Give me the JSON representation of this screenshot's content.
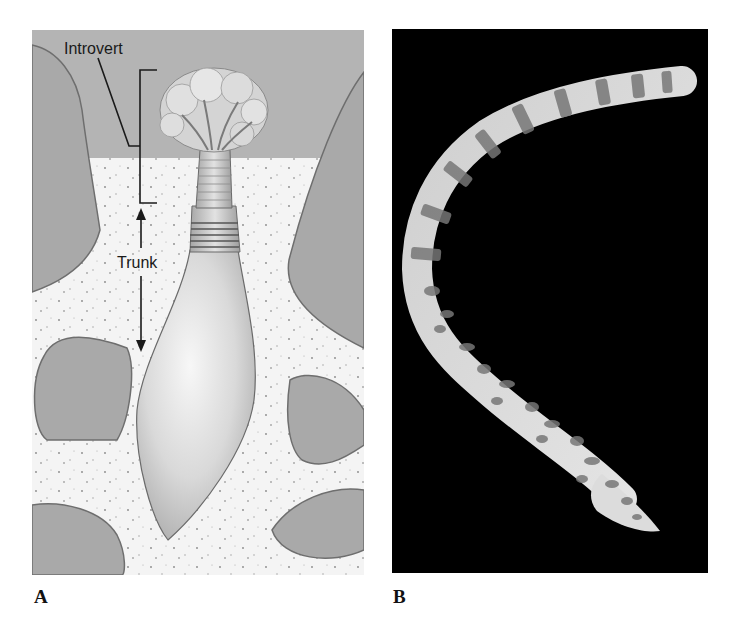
{
  "figure": {
    "panels": [
      {
        "letter": "A",
        "kind": "illustration",
        "labels": {
          "introvert": "Introvert",
          "trunk": "Trunk"
        }
      },
      {
        "letter": "B",
        "kind": "photograph"
      }
    ]
  },
  "colors": {
    "water": "#b4b4b4",
    "sediment": "#f4f4f4",
    "rock": "#a9a9a9",
    "rock_outline": "#6e6e6e",
    "body": "#d6d6d6",
    "photo_background": "#000000",
    "worm_light": "#d8d8d8",
    "worm_spots": "#7a7a7a"
  }
}
